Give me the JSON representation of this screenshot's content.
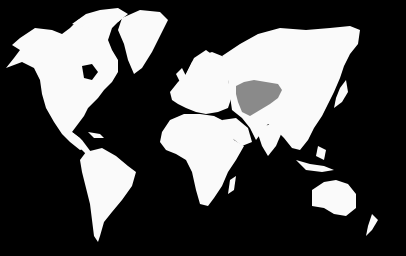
{
  "map": {
    "type": "world-map",
    "projection": "mercator-like",
    "background_color": "#000000",
    "land_color": "#fafafa",
    "highlight": {
      "region": "Mongolia",
      "color": "#8a8a8a"
    },
    "labels": []
  }
}
